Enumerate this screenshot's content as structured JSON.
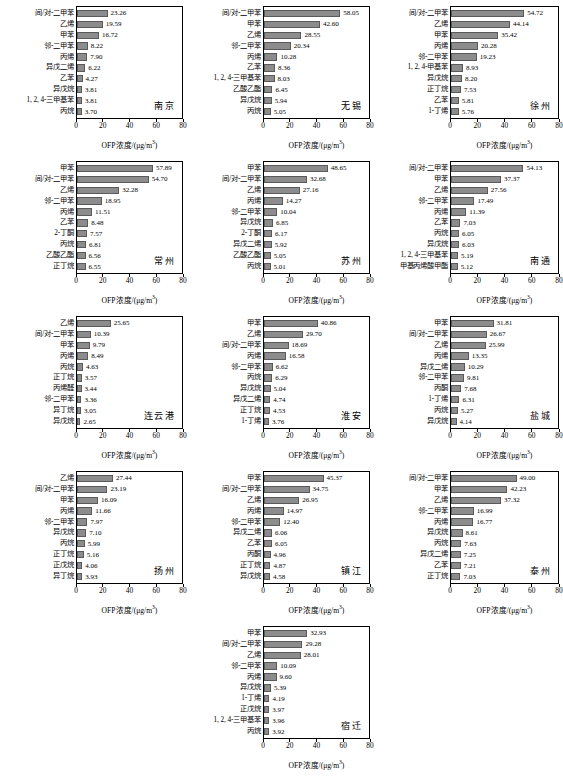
{
  "figure": {
    "axis_title": "OFP浓度/(μg/m",
    "axis_title_sup": "3",
    "axis_title_end": ")",
    "x_ticks": [
      "0",
      "20",
      "40",
      "60",
      "80"
    ],
    "x_min": 0,
    "x_max": 80,
    "bar_color": "#8c8c8c"
  },
  "chart_data": [
    {
      "type": "bar",
      "title": "南京",
      "xlabel": "OFP浓度/(μg/m³)",
      "ylabel": "",
      "xlim": [
        0,
        80
      ],
      "orientation": "horizontal",
      "grid": false,
      "categories": [
        "间/对-二甲苯",
        "乙烯",
        "甲苯",
        "邻-二甲苯",
        "丙烯",
        "异戊二烯",
        "乙苯",
        "异戊烷",
        "1, 2, 4-三甲基苯",
        "丙烷"
      ],
      "values": [
        23.26,
        19.59,
        16.72,
        8.22,
        7.9,
        6.22,
        4.27,
        3.81,
        3.81,
        3.7
      ]
    },
    {
      "type": "bar",
      "title": "无锡",
      "xlabel": "OFP浓度/(μg/m³)",
      "ylabel": "",
      "xlim": [
        0,
        80
      ],
      "orientation": "horizontal",
      "grid": false,
      "categories": [
        "间/对-二甲苯",
        "甲苯",
        "乙烯",
        "邻-二甲苯",
        "丙烯",
        "乙苯",
        "1, 2, 4-三甲基苯",
        "乙酸乙酯",
        "异戊烷",
        "丙烷"
      ],
      "values": [
        58.05,
        42.6,
        28.55,
        20.34,
        10.28,
        8.36,
        8.03,
        6.45,
        5.94,
        5.05
      ]
    },
    {
      "type": "bar",
      "title": "徐州",
      "xlabel": "OFP浓度/(μg/m³)",
      "ylabel": "",
      "xlim": [
        0,
        80
      ],
      "orientation": "horizontal",
      "grid": false,
      "categories": [
        "间/对-二甲苯",
        "乙烯",
        "甲苯",
        "丙烯",
        "邻-二甲苯",
        "1, 2, 4-甲基苯",
        "异戊烷",
        "正丁烷",
        "乙苯",
        "1-丁烯"
      ],
      "values": [
        54.72,
        44.14,
        35.42,
        20.28,
        19.23,
        8.93,
        8.2,
        7.53,
        5.81,
        5.76
      ]
    },
    {
      "type": "bar",
      "title": "常州",
      "xlabel": "OFP浓度/(μg/m³)",
      "ylabel": "",
      "xlim": [
        0,
        80
      ],
      "orientation": "horizontal",
      "grid": false,
      "categories": [
        "甲苯",
        "间/对-二甲苯",
        "乙烯",
        "邻-二甲苯",
        "丙烯",
        "乙苯",
        "2-丁酮",
        "丙烷",
        "乙酸乙酯",
        "正丁烷"
      ],
      "values": [
        57.89,
        54.7,
        32.28,
        18.95,
        11.51,
        8.48,
        7.57,
        6.81,
        6.56,
        6.55
      ]
    },
    {
      "type": "bar",
      "title": "苏州",
      "xlabel": "OFP浓度/(μg/m³)",
      "ylabel": "",
      "xlim": [
        0,
        80
      ],
      "orientation": "horizontal",
      "grid": false,
      "categories": [
        "甲苯",
        "间/对-二甲苯",
        "乙烯",
        "丙烯",
        "邻-二甲苯",
        "异戊烷",
        "2-丁酮",
        "异戊二烯",
        "乙酸乙酯",
        "丙烷"
      ],
      "values": [
        48.65,
        32.68,
        27.16,
        14.27,
        10.04,
        6.85,
        6.17,
        5.92,
        5.05,
        5.01
      ]
    },
    {
      "type": "bar",
      "title": "南通",
      "xlabel": "OFP浓度/(μg/m³)",
      "ylabel": "",
      "xlim": [
        0,
        80
      ],
      "orientation": "horizontal",
      "grid": false,
      "categories": [
        "间/对-二甲苯",
        "甲苯",
        "乙烯",
        "邻-二甲苯",
        "丙烯",
        "乙苯",
        "丙烷",
        "异戊烷",
        "1, 2, 4-三甲基苯",
        "甲基丙烯酸甲酯"
      ],
      "values": [
        54.13,
        37.37,
        27.56,
        17.49,
        11.39,
        7.03,
        6.05,
        6.03,
        5.19,
        5.12
      ]
    },
    {
      "type": "bar",
      "title": "连云港",
      "xlabel": "OFP浓度/(μg/m³)",
      "ylabel": "",
      "xlim": [
        0,
        80
      ],
      "orientation": "horizontal",
      "grid": false,
      "categories": [
        "乙烯",
        "间/对-二甲苯",
        "甲苯",
        "丙烯",
        "丙烷",
        "正丁烷",
        "丙烯醛",
        "邻-二甲苯",
        "异丁烷",
        "异戊烷"
      ],
      "values": [
        25.65,
        10.39,
        9.79,
        8.49,
        4.63,
        3.57,
        3.44,
        3.36,
        3.05,
        2.65
      ]
    },
    {
      "type": "bar",
      "title": "淮安",
      "xlabel": "OFP浓度/(μg/m³)",
      "ylabel": "",
      "xlim": [
        0,
        80
      ],
      "orientation": "horizontal",
      "grid": false,
      "categories": [
        "甲苯",
        "乙烯",
        "间/对-二甲苯",
        "丙烯",
        "邻-二甲苯",
        "丙烷",
        "异戊烷",
        "异戊二烯",
        "正丁烷",
        "1-丁烯"
      ],
      "values": [
        40.86,
        29.7,
        18.69,
        16.58,
        6.62,
        6.29,
        5.04,
        4.74,
        4.53,
        3.76
      ]
    },
    {
      "type": "bar",
      "title": "盐城",
      "xlabel": "OFP浓度/(μg/m³)",
      "ylabel": "",
      "xlim": [
        0,
        80
      ],
      "orientation": "horizontal",
      "grid": false,
      "categories": [
        "甲苯",
        "间/对-二甲苯",
        "乙烯",
        "丙烯",
        "异戊二烯",
        "邻-二甲苯",
        "丙酮",
        "1-丁烯",
        "丙烷",
        "异戊烷"
      ],
      "values": [
        31.81,
        26.67,
        25.99,
        13.35,
        10.29,
        9.81,
        7.68,
        6.31,
        5.27,
        4.14
      ]
    },
    {
      "type": "bar",
      "title": "扬州",
      "xlabel": "OFP浓度/(μg/m³)",
      "ylabel": "",
      "xlim": [
        0,
        80
      ],
      "orientation": "horizontal",
      "grid": false,
      "categories": [
        "乙烯",
        "间/对-二甲苯",
        "甲苯",
        "丙烯",
        "邻-二甲苯",
        "异戊烷",
        "丙烷",
        "正丁烷",
        "正戊烷",
        "异丁烷"
      ],
      "values": [
        27.44,
        23.19,
        16.09,
        11.66,
        7.97,
        7.1,
        5.99,
        5.16,
        4.06,
        3.93
      ]
    },
    {
      "type": "bar",
      "title": "镇江",
      "xlabel": "OFP浓度/(μg/m³)",
      "ylabel": "",
      "xlim": [
        0,
        80
      ],
      "orientation": "horizontal",
      "grid": false,
      "categories": [
        "甲苯",
        "间/对-二甲苯",
        "乙烯",
        "丙烯",
        "邻-二甲苯",
        "异戊二烯",
        "乙苯",
        "丙酮",
        "正丁烷",
        "异戊烷"
      ],
      "values": [
        45.37,
        34.75,
        26.95,
        14.97,
        12.4,
        6.06,
        6.05,
        4.96,
        4.87,
        4.58
      ]
    },
    {
      "type": "bar",
      "title": "泰州",
      "xlabel": "OFP浓度/(μg/m³)",
      "ylabel": "",
      "xlim": [
        0,
        80
      ],
      "orientation": "horizontal",
      "grid": false,
      "categories": [
        "间/对-二甲苯",
        "甲苯",
        "乙烯",
        "邻-二甲苯",
        "丙烯",
        "异戊烷",
        "丙烷",
        "异戊二烯",
        "乙苯",
        "正丁烷"
      ],
      "values": [
        49.0,
        42.23,
        37.32,
        16.99,
        16.77,
        8.61,
        7.63,
        7.25,
        7.21,
        7.03
      ]
    },
    {
      "type": "bar",
      "title": "宿迁",
      "xlabel": "OFP浓度/(μg/m³)",
      "ylabel": "",
      "xlim": [
        0,
        80
      ],
      "orientation": "horizontal",
      "grid": false,
      "categories": [
        "甲苯",
        "间/对-二甲苯",
        "乙烯",
        "邻-二甲苯",
        "丙烯",
        "异戊烷",
        "1-丁烯",
        "正戊烷",
        "1, 2, 4-三甲基苯",
        "丙烷"
      ],
      "values": [
        32.93,
        29.28,
        28.01,
        10.09,
        9.6,
        5.39,
        4.19,
        3.97,
        3.96,
        3.92
      ]
    }
  ]
}
